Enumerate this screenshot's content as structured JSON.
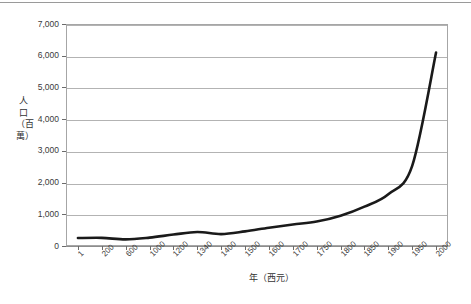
{
  "chart_data": {
    "type": "line",
    "title": "",
    "xlabel": "年（西元）",
    "ylabel": "人口（百萬）",
    "ylim": [
      0,
      7000
    ],
    "ytick_labels": [
      "7,000",
      "6,000",
      "5,000",
      "4,000",
      "3,000",
      "2,000",
      "1,000",
      "0"
    ],
    "ytick_values": [
      7000,
      6000,
      5000,
      4000,
      3000,
      2000,
      1000,
      0
    ],
    "grid": true,
    "legend": "none",
    "axis_kind": "category",
    "categories": [
      "1",
      "200",
      "600",
      "1000",
      "1200",
      "1340",
      "1400",
      "1500",
      "1600",
      "1700",
      "1750",
      "1800",
      "1850",
      "1900",
      "1950",
      "2000"
    ],
    "values": [
      250,
      257,
      208,
      265,
      360,
      443,
      375,
      461,
      578,
      680,
      770,
      954,
      1241,
      1634,
      2525,
      6100
    ],
    "series": [
      {
        "name": "世界人口",
        "values": [
          250,
          257,
          208,
          265,
          360,
          443,
          375,
          461,
          578,
          680,
          770,
          954,
          1241,
          1634,
          2525,
          6100
        ]
      }
    ],
    "line_color": "#1a1a1a",
    "line_width_px": 2.6
  },
  "axes": {
    "y_title": "人口（百萬）",
    "x_title": "年（西元）"
  },
  "colors": {
    "gridline": "#b3b3b3",
    "frame": "#a6a6a6",
    "axis": "#8d8d8d",
    "text": "#3a3a3a",
    "line": "#1a1a1a",
    "top_rule": "#9a9a9a"
  }
}
